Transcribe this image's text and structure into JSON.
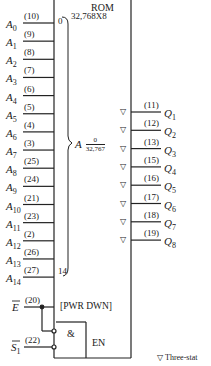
{
  "diagram": {
    "block_title": "ROM",
    "block_size": "32,768X8",
    "address_range": {
      "prefix": "A",
      "top": "0",
      "bottom": "32,767"
    },
    "bus_start": "0",
    "bus_end": "14",
    "address_inputs": [
      {
        "name": "A",
        "sub": "0",
        "pin": "(10)"
      },
      {
        "name": "A",
        "sub": "1",
        "pin": "(9)"
      },
      {
        "name": "A",
        "sub": "2",
        "pin": "(8)"
      },
      {
        "name": "A",
        "sub": "3",
        "pin": "(7)"
      },
      {
        "name": "A",
        "sub": "4",
        "pin": "(6)"
      },
      {
        "name": "A",
        "sub": "5",
        "pin": "(5)"
      },
      {
        "name": "A",
        "sub": "6",
        "pin": "(4)"
      },
      {
        "name": "A",
        "sub": "7",
        "pin": "(3)"
      },
      {
        "name": "A",
        "sub": "8",
        "pin": "(25)"
      },
      {
        "name": "A",
        "sub": "9",
        "pin": "(24)"
      },
      {
        "name": "A",
        "sub": "10",
        "pin": "(21)"
      },
      {
        "name": "A",
        "sub": "11",
        "pin": "(23)"
      },
      {
        "name": "A",
        "sub": "12",
        "pin": "(2)"
      },
      {
        "name": "A",
        "sub": "13",
        "pin": "(26)"
      },
      {
        "name": "A",
        "sub": "14",
        "pin": "(27)"
      }
    ],
    "outputs": [
      {
        "name": "Q",
        "sub": "1",
        "pin": "(11)"
      },
      {
        "name": "Q",
        "sub": "2",
        "pin": "(12)"
      },
      {
        "name": "Q",
        "sub": "3",
        "pin": "(13)"
      },
      {
        "name": "Q",
        "sub": "4",
        "pin": "(15)"
      },
      {
        "name": "Q",
        "sub": "5",
        "pin": "(16)"
      },
      {
        "name": "Q",
        "sub": "6",
        "pin": "(17)"
      },
      {
        "name": "Q",
        "sub": "7",
        "pin": "(18)"
      },
      {
        "name": "Q",
        "sub": "8",
        "pin": "(19)"
      }
    ],
    "enable_input": {
      "name": "E",
      "pin": "(20)"
    },
    "select_input": {
      "name": "S",
      "sub": "1",
      "pin": "(22)"
    },
    "power_down_label": "[PWR DWN]",
    "and_gate_label": "&",
    "enable_label": "EN",
    "three_state_symbol": "▽",
    "legend_text": "Three-stat"
  }
}
